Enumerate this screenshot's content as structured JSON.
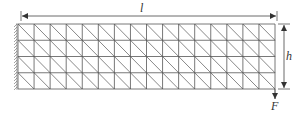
{
  "diagram": {
    "type": "finite-element-mesh",
    "mesh": {
      "columns": 16,
      "rows": 4,
      "element": "triangle",
      "diagonal_direction": "top-left-to-bottom-right"
    },
    "labels": {
      "length": "l",
      "height": "h",
      "force": "F"
    },
    "support": {
      "side": "left",
      "kind": "fixed"
    },
    "load": {
      "location": "bottom-right corner",
      "direction": "down"
    },
    "colors": {
      "line": "#555555",
      "text": "#333333",
      "background": "#ffffff"
    }
  }
}
